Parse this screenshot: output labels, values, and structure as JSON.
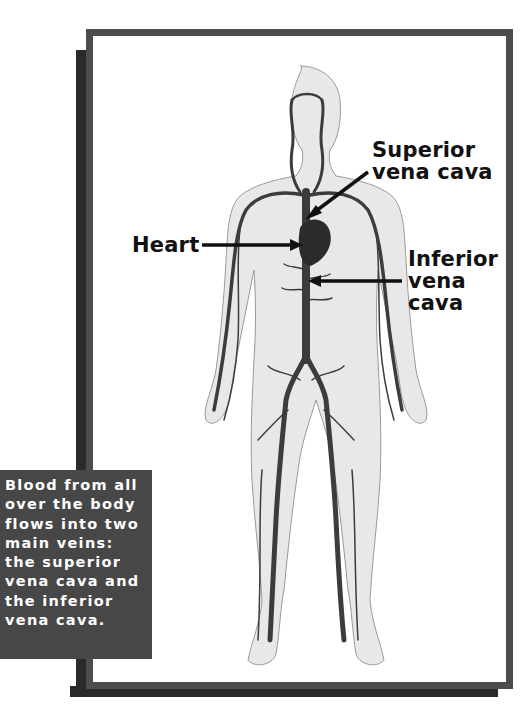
{
  "labels": {
    "superior": [
      "Superior",
      "vena cava"
    ],
    "heart": "Heart",
    "inferior": [
      "Inferior",
      "vena",
      "cava"
    ]
  },
  "caption": {
    "lines": [
      "Blood from all",
      "over the body",
      "flows into two",
      "main veins:",
      "the superior",
      "vena cava and",
      "the inferior",
      "vena cava."
    ]
  },
  "colors": {
    "frame": "#4d4d4d",
    "shadow": "#2a2a2a",
    "caption_bg": "#474747",
    "body_fill": "#e6e6e6",
    "vein": "#3a3a3a"
  }
}
